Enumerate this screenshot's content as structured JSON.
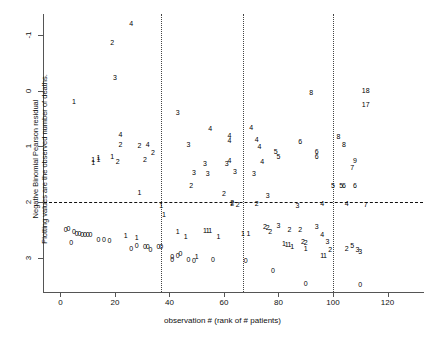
{
  "chart_data": {
    "type": "scatter",
    "title": "",
    "xlabel": "observation # (rank of # patients)",
    "ylabel_line1": "Negative Binomial Pearson residual",
    "ylabel_line2": "Plotting values are the observed number of deaths.",
    "xlim": [
      -6,
      133
    ],
    "ylim": [
      -1.62,
      3.38
    ],
    "xticks": [
      0,
      20,
      40,
      60,
      80,
      100,
      120
    ],
    "yticks": [
      -1,
      0,
      1,
      2,
      3
    ],
    "grid": false,
    "legend": null,
    "annotations": {
      "zero_reference_line": {
        "y": 0,
        "style": "dashed"
      },
      "vertical_divider_lines": {
        "x": [
          37,
          67,
          100
        ],
        "style": "dotted"
      }
    },
    "marker_style": "text-label = observed number of deaths",
    "points": [
      {
        "x": 2,
        "y": -0.48,
        "label": "0"
      },
      {
        "x": 3,
        "y": -0.47,
        "label": "0"
      },
      {
        "x": 4,
        "y": -0.72,
        "label": "0"
      },
      {
        "x": 5,
        "y": -0.52,
        "label": "0"
      },
      {
        "x": 6,
        "y": -0.55,
        "label": "0"
      },
      {
        "x": 7,
        "y": -0.56,
        "label": "0"
      },
      {
        "x": 8,
        "y": -0.57,
        "label": "0"
      },
      {
        "x": 9,
        "y": -0.57,
        "label": "0"
      },
      {
        "x": 10,
        "y": -0.58,
        "label": "0"
      },
      {
        "x": 11,
        "y": -0.58,
        "label": "0"
      },
      {
        "x": 5,
        "y": 1.82,
        "label": "1"
      },
      {
        "x": 12,
        "y": 0.78,
        "label": "1"
      },
      {
        "x": 12,
        "y": 0.72,
        "label": "1"
      },
      {
        "x": 14,
        "y": 0.8,
        "label": "1"
      },
      {
        "x": 14,
        "y": 0.78,
        "label": "1"
      },
      {
        "x": 14,
        "y": -0.66,
        "label": "0"
      },
      {
        "x": 16,
        "y": -0.66,
        "label": "0"
      },
      {
        "x": 18,
        "y": -0.68,
        "label": "0"
      },
      {
        "x": 19,
        "y": 0.82,
        "label": "1"
      },
      {
        "x": 20,
        "y": 2.25,
        "label": "3"
      },
      {
        "x": 21,
        "y": 0.74,
        "label": "2"
      },
      {
        "x": 22,
        "y": 1.22,
        "label": "4"
      },
      {
        "x": 22,
        "y": 1.04,
        "label": "2"
      },
      {
        "x": 19,
        "y": 2.87,
        "label": "2"
      },
      {
        "x": 26,
        "y": 3.22,
        "label": "4"
      },
      {
        "x": 24,
        "y": -0.6,
        "label": "1"
      },
      {
        "x": 26,
        "y": -0.83,
        "label": "0"
      },
      {
        "x": 28,
        "y": -0.78,
        "label": "0"
      },
      {
        "x": 29,
        "y": 0.17,
        "label": "1"
      },
      {
        "x": 28,
        "y": -0.63,
        "label": "1"
      },
      {
        "x": 31,
        "y": -0.8,
        "label": "0"
      },
      {
        "x": 32,
        "y": -0.8,
        "label": "0"
      },
      {
        "x": 33,
        "y": -0.84,
        "label": "0"
      },
      {
        "x": 29,
        "y": 1.03,
        "label": "2"
      },
      {
        "x": 31,
        "y": 0.77,
        "label": "2"
      },
      {
        "x": 32,
        "y": 1.05,
        "label": "4"
      },
      {
        "x": 34,
        "y": 0.9,
        "label": "2"
      },
      {
        "x": 36,
        "y": -0.8,
        "label": "0"
      },
      {
        "x": 37,
        "y": -0.8,
        "label": "0"
      },
      {
        "x": 37,
        "y": -0.05,
        "label": "1"
      },
      {
        "x": 38,
        "y": -0.22,
        "label": "1"
      },
      {
        "x": 41,
        "y": -0.98,
        "label": "0"
      },
      {
        "x": 41,
        "y": -1.02,
        "label": "0"
      },
      {
        "x": 43,
        "y": -0.96,
        "label": "0"
      },
      {
        "x": 44,
        "y": -0.92,
        "label": "0"
      },
      {
        "x": 43,
        "y": -0.52,
        "label": "1"
      },
      {
        "x": 46,
        "y": -0.62,
        "label": "1"
      },
      {
        "x": 43,
        "y": 1.62,
        "label": "3"
      },
      {
        "x": 47,
        "y": -1.02,
        "label": "0"
      },
      {
        "x": 49,
        "y": -1.04,
        "label": "0"
      },
      {
        "x": 50,
        "y": -0.98,
        "label": "1"
      },
      {
        "x": 48,
        "y": 0.3,
        "label": "2"
      },
      {
        "x": 49,
        "y": 0.53,
        "label": "3"
      },
      {
        "x": 47,
        "y": 1.04,
        "label": "3"
      },
      {
        "x": 53,
        "y": -0.5,
        "label": "1"
      },
      {
        "x": 54,
        "y": -0.51,
        "label": "1"
      },
      {
        "x": 55,
        "y": -0.51,
        "label": "1"
      },
      {
        "x": 56,
        "y": -1.02,
        "label": "0"
      },
      {
        "x": 53,
        "y": 0.7,
        "label": "3"
      },
      {
        "x": 54,
        "y": 0.52,
        "label": "3"
      },
      {
        "x": 55,
        "y": 1.33,
        "label": "4"
      },
      {
        "x": 58,
        "y": -0.62,
        "label": "1"
      },
      {
        "x": 60,
        "y": 0.16,
        "label": "2"
      },
      {
        "x": 61,
        "y": 0.7,
        "label": "3"
      },
      {
        "x": 62,
        "y": 0.76,
        "label": "4"
      },
      {
        "x": 62,
        "y": 1.2,
        "label": "4"
      },
      {
        "x": 62,
        "y": 1.12,
        "label": "4"
      },
      {
        "x": 63,
        "y": -0.02,
        "label": "2"
      },
      {
        "x": 63,
        "y": 0.0,
        "label": "2"
      },
      {
        "x": 65,
        "y": -0.03,
        "label": "2"
      },
      {
        "x": 64,
        "y": 0.56,
        "label": "3"
      },
      {
        "x": 67,
        "y": -0.55,
        "label": "1"
      },
      {
        "x": 69,
        "y": -0.55,
        "label": "1"
      },
      {
        "x": 68,
        "y": -1.04,
        "label": "0"
      },
      {
        "x": 70,
        "y": 1.35,
        "label": "4"
      },
      {
        "x": 71,
        "y": 0.52,
        "label": "3"
      },
      {
        "x": 72,
        "y": 1.14,
        "label": "4"
      },
      {
        "x": 73,
        "y": 1.0,
        "label": "4"
      },
      {
        "x": 74,
        "y": 0.73,
        "label": "4"
      },
      {
        "x": 72,
        "y": -0.02,
        "label": "2"
      },
      {
        "x": 75,
        "y": -0.44,
        "label": "2"
      },
      {
        "x": 76,
        "y": -0.45,
        "label": "2"
      },
      {
        "x": 77,
        "y": -0.52,
        "label": "2"
      },
      {
        "x": 76,
        "y": 0.12,
        "label": "3"
      },
      {
        "x": 78,
        "y": -1.22,
        "label": "0"
      },
      {
        "x": 79,
        "y": 0.91,
        "label": "5"
      },
      {
        "x": 80,
        "y": 0.83,
        "label": "5"
      },
      {
        "x": 80,
        "y": -0.41,
        "label": "3"
      },
      {
        "x": 82,
        "y": -0.73,
        "label": "1"
      },
      {
        "x": 83,
        "y": -0.75,
        "label": "1"
      },
      {
        "x": 84,
        "y": -0.76,
        "label": "1"
      },
      {
        "x": 85,
        "y": -0.8,
        "label": "1"
      },
      {
        "x": 84,
        "y": -0.49,
        "label": "2"
      },
      {
        "x": 87,
        "y": -0.05,
        "label": "3"
      },
      {
        "x": 88,
        "y": 1.09,
        "label": "6"
      },
      {
        "x": 88,
        "y": -0.49,
        "label": "2"
      },
      {
        "x": 89,
        "y": -0.7,
        "label": "2"
      },
      {
        "x": 90,
        "y": -0.72,
        "label": "2"
      },
      {
        "x": 90,
        "y": -0.83,
        "label": "1"
      },
      {
        "x": 90,
        "y": -1.45,
        "label": "0"
      },
      {
        "x": 92,
        "y": 1.98,
        "label": "8"
      },
      {
        "x": 94,
        "y": 0.92,
        "label": "6"
      },
      {
        "x": 94,
        "y": 0.82,
        "label": "6"
      },
      {
        "x": 94,
        "y": -0.43,
        "label": "3"
      },
      {
        "x": 96,
        "y": -0.58,
        "label": "4"
      },
      {
        "x": 96,
        "y": -0.95,
        "label": "1"
      },
      {
        "x": 97,
        "y": -0.95,
        "label": "1"
      },
      {
        "x": 96,
        "y": -0.02,
        "label": "4"
      },
      {
        "x": 98,
        "y": -0.7,
        "label": "3"
      },
      {
        "x": 99,
        "y": -0.85,
        "label": "2"
      },
      {
        "x": 100,
        "y": 0.3,
        "label": "5"
      },
      {
        "x": 102,
        "y": 1.18,
        "label": "8"
      },
      {
        "x": 103,
        "y": 0.3,
        "label": "5"
      },
      {
        "x": 104,
        "y": 0.3,
        "label": "6"
      },
      {
        "x": 104,
        "y": 1.04,
        "label": "8"
      },
      {
        "x": 105,
        "y": -0.02,
        "label": "4"
      },
      {
        "x": 105,
        "y": -0.82,
        "label": "2"
      },
      {
        "x": 107,
        "y": 0.62,
        "label": "7"
      },
      {
        "x": 107,
        "y": -0.78,
        "label": "5"
      },
      {
        "x": 108,
        "y": 0.75,
        "label": "9"
      },
      {
        "x": 108,
        "y": 0.3,
        "label": "6"
      },
      {
        "x": 109,
        "y": -0.85,
        "label": "3"
      },
      {
        "x": 110,
        "y": -0.88,
        "label": "3"
      },
      {
        "x": 110,
        "y": -1.48,
        "label": "0"
      },
      {
        "x": 112,
        "y": 2.02,
        "label": "18"
      },
      {
        "x": 112,
        "y": 1.77,
        "label": "17"
      },
      {
        "x": 112,
        "y": -0.03,
        "label": "7"
      }
    ]
  },
  "axis": {
    "x_tick_labels": [
      "0",
      "20",
      "40",
      "60",
      "80",
      "100",
      "120"
    ],
    "y_tick_labels": [
      "3",
      "2",
      "1",
      "0",
      "-1"
    ]
  },
  "colors": {
    "point": "#000000",
    "axis": "#555555",
    "zero_line": "#111111",
    "divider_line": "#444444",
    "background": "#ffffff"
  }
}
